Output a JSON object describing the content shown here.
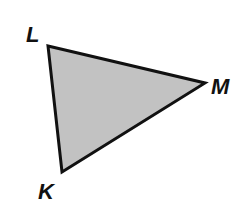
{
  "diagram": {
    "type": "triangle",
    "fill_color": "#c2c2c2",
    "stroke_color": "#111111",
    "vertices": [
      {
        "name": "L",
        "x": 48,
        "y": 46,
        "label_x": 26,
        "label_y": 42
      },
      {
        "name": "M",
        "x": 205,
        "y": 83,
        "label_x": 211,
        "label_y": 94
      },
      {
        "name": "K",
        "x": 62,
        "y": 172,
        "label_x": 38,
        "label_y": 199
      }
    ]
  }
}
